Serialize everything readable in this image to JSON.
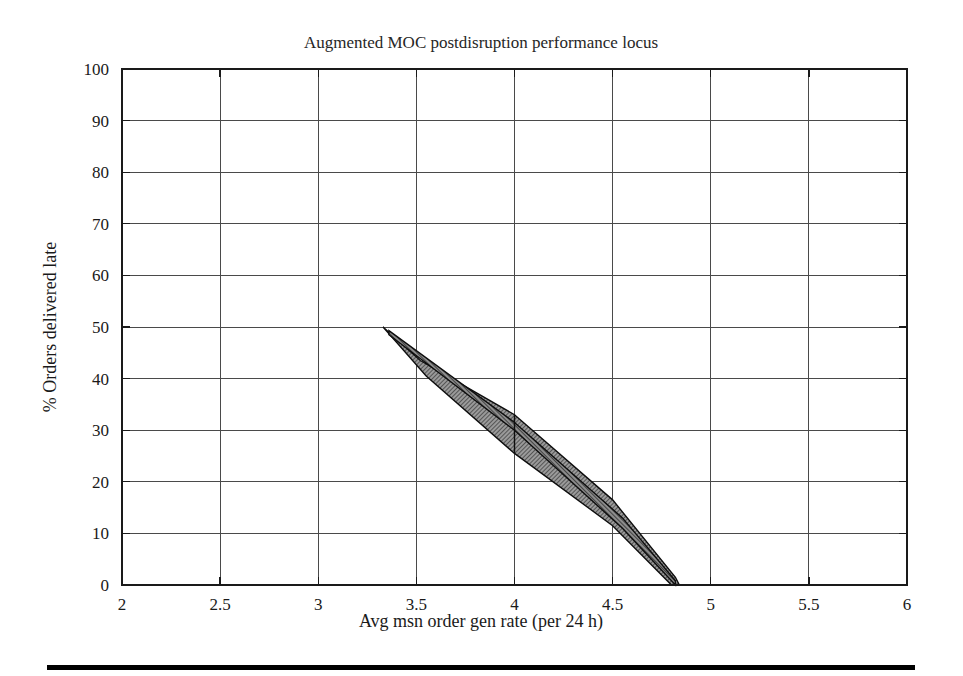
{
  "figure": {
    "background_color": "#ffffff",
    "bottom_rule": {
      "name": "horizontal-rule",
      "x1": 47,
      "x2": 915,
      "y": 667,
      "color": "#000000"
    }
  },
  "chart_data": {
    "type": "area",
    "title": "Augmented MOC postdisruption performance locus",
    "xlabel": "Avg msn order gen rate (per 24 h)",
    "ylabel": "% Orders delivered late",
    "xlim": [
      2,
      6
    ],
    "ylim": [
      0,
      100
    ],
    "xticks": [
      2,
      2.5,
      3,
      3.5,
      4,
      4.5,
      5,
      5.5,
      6
    ],
    "xtick_labels": [
      "2",
      "2.5",
      "3",
      "3.5",
      "4",
      "4.5",
      "5",
      "5.5",
      "6"
    ],
    "yticks": [
      0,
      10,
      20,
      30,
      40,
      50,
      60,
      70,
      80,
      90,
      100
    ],
    "ytick_labels": [
      "0",
      "10",
      "20",
      "30",
      "40",
      "50",
      "60",
      "70",
      "80",
      "90",
      "100"
    ],
    "grid": true,
    "legend": null,
    "fill_color": "#6e6e6e",
    "fill_pattern": "hatch-dither",
    "outline_color": "#0d0d0d",
    "series": [
      {
        "name": "performance-locus-envelope",
        "role": "outer-band",
        "description": "Shaded uncertainty envelope of the postdisruption performance locus",
        "upper_edge": [
          [
            3.33,
            50.0
          ],
          [
            3.52,
            43.5
          ],
          [
            4.0,
            33.0
          ],
          [
            4.5,
            16.5
          ],
          [
            4.82,
            1.5
          ],
          [
            4.84,
            0.0
          ]
        ],
        "lower_edge": [
          [
            4.84,
            0.0
          ],
          [
            4.8,
            0.0
          ],
          [
            4.5,
            11.5
          ],
          [
            4.0,
            25.5
          ],
          [
            3.55,
            40.5
          ],
          [
            3.4,
            47.0
          ],
          [
            3.33,
            50.0
          ]
        ]
      },
      {
        "name": "performance-locus-nominal",
        "role": "inner-locus",
        "description": "Narrow inner locus line running through the envelope",
        "upper_edge": [
          [
            3.36,
            49.3
          ],
          [
            4.0,
            31.5
          ],
          [
            4.55,
            13.0
          ],
          [
            4.82,
            0.8
          ]
        ],
        "lower_edge": [
          [
            4.82,
            0.0
          ],
          [
            4.55,
            11.0
          ],
          [
            4.0,
            30.0
          ],
          [
            3.36,
            48.5
          ]
        ]
      }
    ],
    "annotations": [
      {
        "name": "mid-kink-connector",
        "type": "vertical-segment",
        "x": 4.0,
        "y_from": 25.5,
        "y_to": 33.0
      }
    ]
  }
}
